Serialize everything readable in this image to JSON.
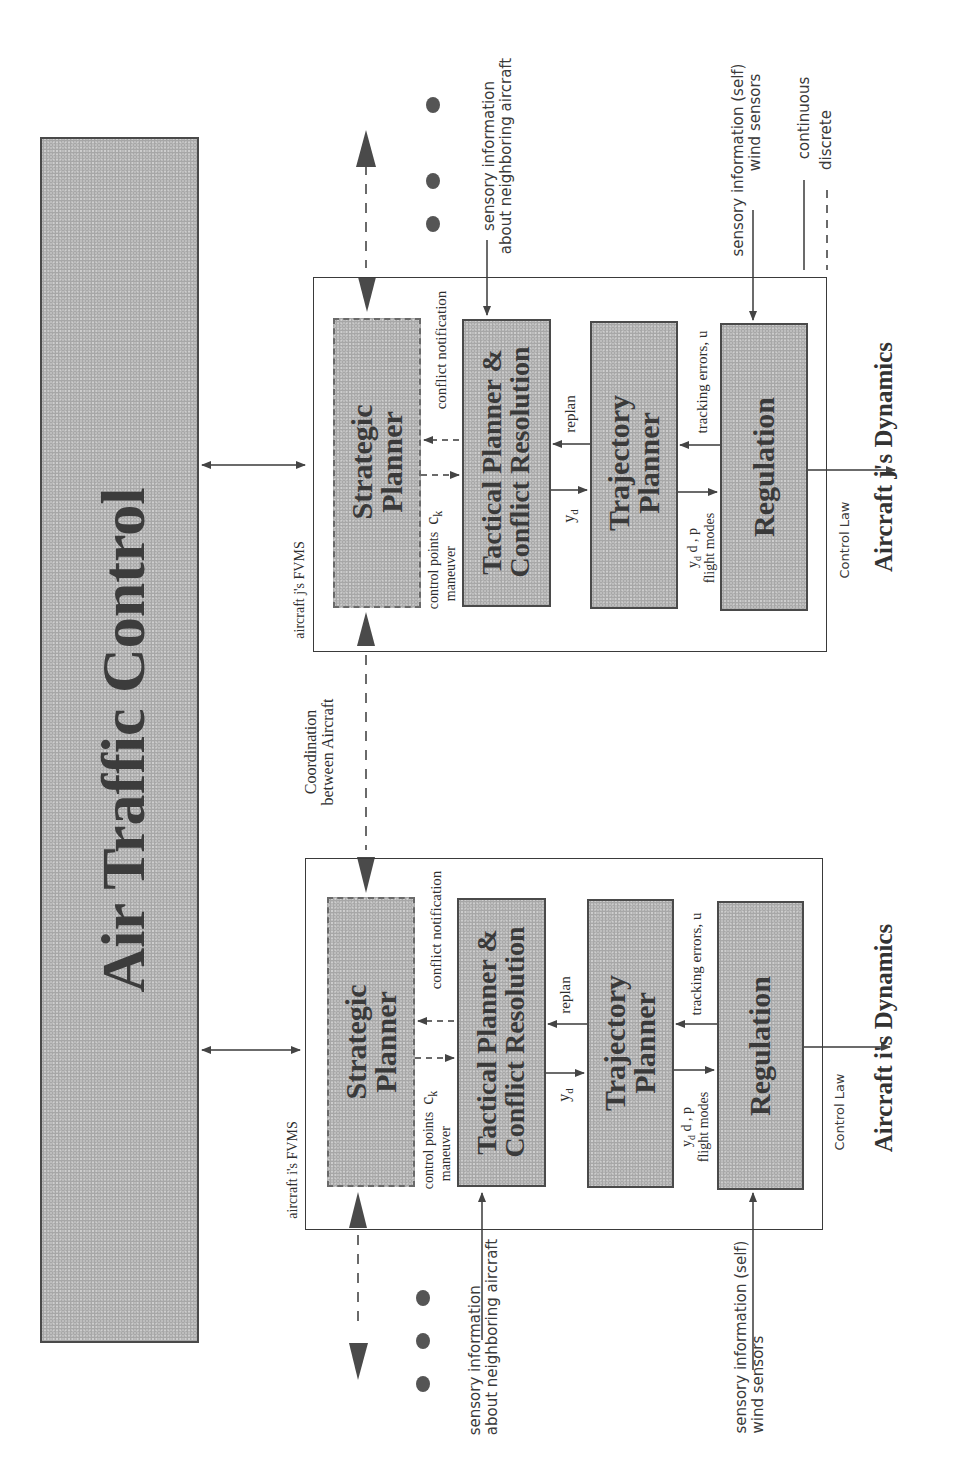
{
  "figure": {
    "orientation": "rotated-90-ccw",
    "colors": {
      "block_fill": "#bdbdbd",
      "line": "#3a3a3a",
      "background": "#ffffff"
    }
  },
  "atc": {
    "title": "Air Traffic Control"
  },
  "coordination_label": {
    "line1": "Coordination",
    "line2": "between Aircraft"
  },
  "legend": {
    "items": [
      {
        "style": "solid",
        "label": "continuous"
      },
      {
        "style": "dashed",
        "label": "discrete"
      }
    ]
  },
  "aircraft_j": {
    "fvms_label": "aircraft j's FVMS",
    "dynamics_label": "Aircraft j's Dynamics",
    "blocks": {
      "strategic": {
        "line1": "Strategic",
        "line2": "Planner"
      },
      "tactical": {
        "line1": "Tactical Planner  &",
        "line2": "Conflict Resolution"
      },
      "trajectory": {
        "line1": "Trajectory",
        "line2": "Planner"
      },
      "regulation": {
        "line1": "Regulation"
      }
    },
    "signals": {
      "control_points": "control points",
      "maneuver": "maneuver",
      "ck": "c",
      "ck_sub": "k",
      "conflict_notification": "conflict notification",
      "yd": "y",
      "yd_sub": "d",
      "replan": "replan",
      "traj_out": "y",
      "traj_out_rest": "d , p",
      "traj_out_rest2": "d , u",
      "traj_out_sub": "d",
      "flight_modes": "flight modes",
      "tracking_errors": "tracking errors, u",
      "control_law": "Control Law"
    },
    "sensory_neighbor": {
      "line1": "sensory information",
      "line2": "about neighboring aircraft"
    },
    "sensory_self": {
      "line1": "sensory information (self)",
      "line2": "wind sensors"
    }
  },
  "aircraft_i": {
    "fvms_label": "aircraft i's FVMS",
    "dynamics_label": "Aircraft i's Dynamics",
    "blocks": {
      "strategic": {
        "line1": "Strategic",
        "line2": "Planner"
      },
      "tactical": {
        "line1": "Tactical Planner  &",
        "line2": "Conflict Resolution"
      },
      "trajectory": {
        "line1": "Trajectory",
        "line2": "Planner"
      },
      "regulation": {
        "line1": "Regulation"
      }
    },
    "signals": {
      "control_points": "control points",
      "maneuver": "maneuver",
      "ck": "c",
      "ck_sub": "k",
      "conflict_notification": "conflict notification",
      "yd": "y",
      "yd_sub": "d",
      "replan": "replan",
      "traj_out": "y",
      "traj_out_rest": "d , p",
      "traj_out_rest2": "d , u",
      "traj_out_sub": "d",
      "flight_modes": "flight modes",
      "tracking_errors": "tracking errors, u",
      "control_law": "Control Law"
    },
    "sensory_neighbor": {
      "line1": "sensory information",
      "line2": "about neighboring aircraft"
    },
    "sensory_self": {
      "line1": "sensory information (self)",
      "line2": "wind sensors"
    }
  },
  "ellipsis_top": "•••",
  "ellipsis_bottom": "•••"
}
